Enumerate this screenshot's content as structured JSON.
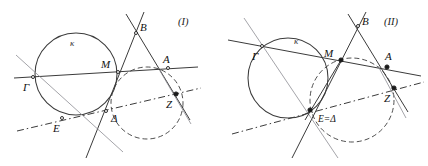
{
  "figure": {
    "background_color": "#ffffff",
    "stroke_color": "#3b3b3b",
    "stroke_color_light": "#8d8d93",
    "point_color": "#1a1a1a",
    "label_color": "#111111"
  },
  "panels": [
    {
      "id": "panel-1",
      "caption": "(I)",
      "caption_pos": {
        "x": 178,
        "y": 25
      },
      "curve_label": "κ",
      "curve_label_pos": {
        "x": 70,
        "y": 46
      },
      "circles": [
        {
          "name": "circle-kappa",
          "cx": 76,
          "cy": 74,
          "r": 41,
          "style": "solid"
        },
        {
          "name": "circle-dashed",
          "cx": 147,
          "cy": 103,
          "r": 36,
          "style": "dashed"
        }
      ],
      "lines": [
        {
          "name": "line-gamma-m-a",
          "x1": 14,
          "y1": 78,
          "x2": 198,
          "y2": 67,
          "style": "solid"
        },
        {
          "name": "line-b-delta",
          "x1": 144,
          "y1": 12,
          "x2": 86,
          "y2": 158,
          "style": "solid"
        },
        {
          "name": "line-b-a-z",
          "x1": 126,
          "y1": 14,
          "x2": 190,
          "y2": 120,
          "style": "solid"
        },
        {
          "name": "line-gamma-delta",
          "x1": 16,
          "y1": 55,
          "x2": 123,
          "y2": 152,
          "style": "light"
        },
        {
          "name": "line-e-delta-z-dashdot",
          "x1": 17,
          "y1": 131,
          "x2": 201,
          "y2": 88,
          "style": "dashdot"
        },
        {
          "name": "line-z-cross",
          "x1": 160,
          "y1": 71,
          "x2": 191,
          "y2": 124,
          "style": "light"
        }
      ],
      "points": [
        {
          "name": "point-gamma",
          "label": "Γ",
          "x": 33,
          "y": 77,
          "lx": 23,
          "ly": 91,
          "filled": false
        },
        {
          "name": "point-m",
          "label": "M",
          "x": 118,
          "y": 72,
          "lx": 101,
          "ly": 68,
          "filled": false
        },
        {
          "name": "point-a",
          "label": "A",
          "x": 168,
          "y": 68,
          "lx": 163,
          "ly": 63,
          "filled": false
        },
        {
          "name": "point-b",
          "label": "B",
          "x": 136,
          "y": 33,
          "lx": 140,
          "ly": 31,
          "filled": false
        },
        {
          "name": "point-e",
          "label": "E",
          "x": 62,
          "y": 118,
          "lx": 53,
          "ly": 132,
          "filled": false
        },
        {
          "name": "point-delta",
          "label": "Δ",
          "x": 106,
          "y": 111,
          "lx": 111,
          "ly": 122,
          "filled": false
        },
        {
          "name": "point-z",
          "label": "Z",
          "x": 176,
          "y": 94,
          "lx": 166,
          "ly": 108,
          "filled": true
        }
      ]
    },
    {
      "id": "panel-2",
      "caption": "(II)",
      "caption_pos": {
        "x": 384,
        "y": 25
      },
      "curve_label": "κ",
      "curve_label_pos": {
        "x": 294,
        "y": 44
      },
      "circles": [
        {
          "name": "circle-kappa",
          "cx": 288,
          "cy": 78,
          "r": 40,
          "style": "solid"
        },
        {
          "name": "circle-dashed",
          "cx": 352,
          "cy": 100,
          "r": 42,
          "style": "dashed"
        }
      ],
      "lines": [
        {
          "name": "line-gamma-m-a",
          "x1": 228,
          "y1": 40,
          "x2": 421,
          "y2": 76,
          "style": "solid"
        },
        {
          "name": "line-b-edelta",
          "x1": 366,
          "y1": 12,
          "x2": 292,
          "y2": 158,
          "style": "solid"
        },
        {
          "name": "line-b-a-z",
          "x1": 348,
          "y1": 14,
          "x2": 408,
          "y2": 112,
          "style": "solid"
        },
        {
          "name": "line-gamma-edelta",
          "x1": 244,
          "y1": 18,
          "x2": 338,
          "y2": 158,
          "style": "light"
        },
        {
          "name": "line-m-edelta",
          "x1": 341,
          "y1": 60,
          "x2": 305,
          "y2": 120,
          "style": "solid"
        },
        {
          "name": "line-edelta-z-dashdot",
          "x1": 232,
          "y1": 134,
          "x2": 424,
          "y2": 82,
          "style": "dashdot"
        },
        {
          "name": "line-z-cross",
          "x1": 378,
          "y1": 66,
          "x2": 406,
          "y2": 118,
          "style": "light"
        }
      ],
      "points": [
        {
          "name": "point-gamma",
          "label": "Γ",
          "x": 262,
          "y": 46,
          "lx": 252,
          "ly": 60,
          "filled": false
        },
        {
          "name": "point-m",
          "label": "M",
          "x": 341,
          "y": 60,
          "lx": 324,
          "ly": 57,
          "filled": true
        },
        {
          "name": "point-a",
          "label": "A",
          "x": 387,
          "y": 67,
          "lx": 385,
          "ly": 60,
          "filled": true
        },
        {
          "name": "point-b",
          "label": "B",
          "x": 358,
          "y": 26,
          "lx": 362,
          "ly": 25,
          "filled": false
        },
        {
          "name": "point-e-delta",
          "label": "E=Δ",
          "x": 310,
          "y": 110,
          "lx": 318,
          "ly": 122,
          "filled": true
        },
        {
          "name": "point-z",
          "label": "Z",
          "x": 394,
          "y": 88,
          "lx": 384,
          "ly": 102,
          "filled": true
        }
      ]
    }
  ]
}
